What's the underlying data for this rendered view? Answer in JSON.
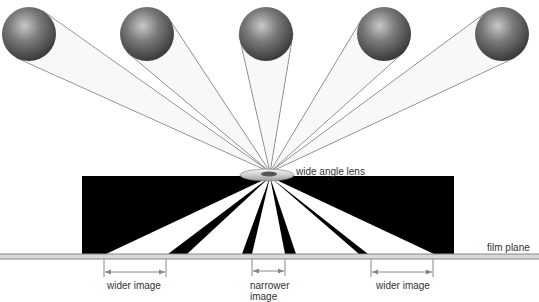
{
  "diagram": {
    "labels": {
      "lens": "wide angle lens",
      "film_plane": "film plane",
      "wider_left": "wider image",
      "narrower_line1": "narrower",
      "narrower_line2": "image",
      "wider_right": "wider image"
    },
    "colors": {
      "sphere_dark": "#3a3a3a",
      "sphere_mid": "#7a7a7a",
      "sphere_light": "#c8c8c8",
      "ray_line": "#555555",
      "box_fill": "#000000",
      "wedge_fill": "#ffffff",
      "film_line": "#888888",
      "dimension_line": "#888888"
    },
    "spheres": [
      {
        "cx": 29,
        "cy": 34,
        "r": 27
      },
      {
        "cx": 147,
        "cy": 34,
        "r": 27
      },
      {
        "cx": 266,
        "cy": 34,
        "r": 27
      },
      {
        "cx": 384,
        "cy": 34,
        "r": 27
      },
      {
        "cx": 502,
        "cy": 34,
        "r": 27
      }
    ],
    "focal_point": {
      "x": 270,
      "y": 172
    },
    "lens": {
      "cx": 267,
      "cy": 175,
      "rx": 27,
      "ry": 6
    },
    "box": {
      "x": 82,
      "y": 176,
      "width": 372,
      "height": 78
    },
    "film_plane_y": 256,
    "wedges_on_film": [
      [
        106,
        168
      ],
      [
        187,
        242
      ],
      [
        252,
        285
      ],
      [
        296,
        359
      ],
      [
        368,
        434
      ]
    ],
    "dimensions": [
      {
        "x1": 104,
        "x2": 166,
        "y": 272
      },
      {
        "x1": 252,
        "x2": 285,
        "y": 271
      },
      {
        "x1": 371,
        "x2": 433,
        "y": 272
      }
    ]
  }
}
